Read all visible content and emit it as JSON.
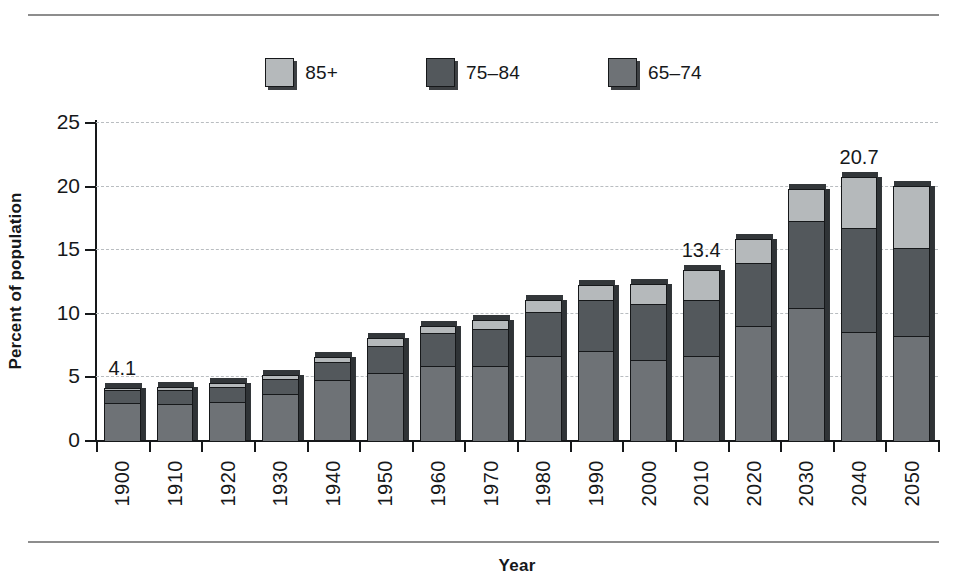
{
  "chart_data": {
    "type": "bar",
    "subtype": "stacked",
    "title": "",
    "xlabel": "Year",
    "ylabel": "Percent of population",
    "ylim": [
      0,
      25
    ],
    "yticks": [
      0,
      5,
      10,
      15,
      20,
      25
    ],
    "grid": true,
    "legend_position": "top-center",
    "categories": [
      "1900",
      "1910",
      "1920",
      "1930",
      "1940",
      "1950",
      "1960",
      "1970",
      "1980",
      "1990",
      "2000",
      "2010",
      "2020",
      "2030",
      "2040",
      "2050"
    ],
    "series": [
      {
        "name": "65-74",
        "color": "#6e7276",
        "values": [
          2.9,
          2.8,
          3.0,
          3.6,
          4.6,
          5.3,
          5.8,
          5.8,
          6.6,
          7.0,
          6.3,
          6.6,
          9.0,
          10.4,
          8.5,
          8.2
        ]
      },
      {
        "name": "75-84",
        "color": "#53585c",
        "values": [
          1.0,
          1.1,
          1.2,
          1.2,
          1.4,
          2.1,
          2.6,
          2.9,
          3.5,
          4.0,
          4.4,
          4.4,
          4.9,
          6.8,
          8.2,
          6.9
        ]
      },
      {
        "name": "85+",
        "color": "#b5b9bb",
        "values": [
          0.2,
          0.3,
          0.3,
          0.3,
          0.4,
          0.6,
          0.6,
          0.7,
          0.9,
          1.2,
          1.6,
          2.4,
          1.9,
          2.5,
          4.0,
          4.9
        ]
      }
    ],
    "totals": [
      4.1,
      4.2,
      4.5,
      5.1,
      6.5,
      8.0,
      9.0,
      9.4,
      11.0,
      12.2,
      12.3,
      13.4,
      15.8,
      19.7,
      20.7,
      20.0
    ],
    "annotations": [
      {
        "category": "1900",
        "text": "4.1",
        "value": 4.1
      },
      {
        "category": "2010",
        "text": "13.4",
        "value": 13.4
      },
      {
        "category": "2040",
        "text": "20.7",
        "value": 20.7
      }
    ]
  },
  "legend": {
    "items": [
      {
        "label": "85+",
        "color": "#b5b9bb"
      },
      {
        "label": "75-84",
        "color": "#53585c"
      },
      {
        "label": "65-74",
        "color": "#6e7276"
      }
    ]
  },
  "axes": {
    "y_title": "Percent of population",
    "x_title": "Year",
    "y_tick_labels": [
      "0",
      "5",
      "10",
      "15",
      "20",
      "25"
    ],
    "x_tick_labels": [
      "1900",
      "1910",
      "1920",
      "1930",
      "1940",
      "1950",
      "1960",
      "1970",
      "1980",
      "1990",
      "2000",
      "2010",
      "2020",
      "2030",
      "2040",
      "2050"
    ]
  }
}
